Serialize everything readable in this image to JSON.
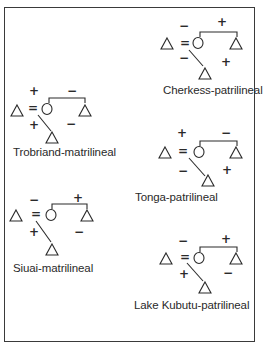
{
  "figure": {
    "type": "kinship-attitude-diagrams",
    "panels": [
      {
        "id": "cherkess",
        "label": "Cherkess-patrilineal",
        "husband_wife": "−",
        "brother_sister": "+",
        "father_son": "−",
        "mothersbrother_sisterson": "+"
      },
      {
        "id": "trobriand",
        "label": "Trobriand-matrilineal",
        "husband_wife": "+",
        "brother_sister": "−",
        "father_son": "+",
        "mothersbrother_sisterson": "−"
      },
      {
        "id": "tonga",
        "label": "Tonga-patrilineal",
        "husband_wife": "+",
        "brother_sister": "−",
        "father_son": "−",
        "mothersbrother_sisterson": "+"
      },
      {
        "id": "siuai",
        "label": "Siuai-matrilineal",
        "husband_wife": "−",
        "brother_sister": "+",
        "father_son": "+",
        "mothersbrother_sisterson": "−"
      },
      {
        "id": "kubutu",
        "label": "Lake Kubutu-patrilineal",
        "husband_wife": "−",
        "brother_sister": "+",
        "father_son": "+",
        "mothersbrother_sisterson": "−"
      }
    ],
    "symbols": {
      "male": "triangle-icon",
      "female": "circle-icon",
      "marriage": "=",
      "sibling_link": "bracket",
      "descent": "diagonal-line"
    },
    "colors": {
      "ink": "#2a2a2a",
      "background": "#ffffff",
      "border": "#3a3a3a"
    }
  }
}
